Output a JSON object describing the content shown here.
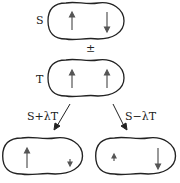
{
  "diagram": {
    "singlet_label": "S",
    "operator_label": "±",
    "triplet_label": "T",
    "left_branch_label": "S+λT",
    "right_branch_label": "S−λT",
    "states": [
      {
        "name": "singlet",
        "spins": [
          "up",
          "down"
        ]
      },
      {
        "name": "triplet",
        "spins": [
          "up",
          "up"
        ]
      },
      {
        "name": "s-plus-lambda-t",
        "spins": [
          "up-large",
          "down-small"
        ]
      },
      {
        "name": "s-minus-lambda-t",
        "spins": [
          "up-small",
          "down-large"
        ]
      }
    ],
    "colors": {
      "outline": "#222222",
      "arrow": "#555555"
    }
  }
}
